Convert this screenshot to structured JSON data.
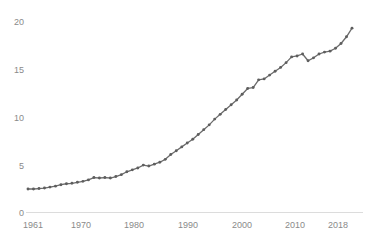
{
  "chart_data": {
    "type": "line",
    "title": "",
    "subtitle": "",
    "xlabel": "",
    "ylabel": "",
    "xlim": [
      1961,
      2020
    ],
    "ylim": [
      0,
      20
    ],
    "grid": false,
    "legend": null,
    "legend_position": "none",
    "marker": "circle",
    "line_color": "#6b6b6b",
    "marker_color": "#5e5e5e",
    "axis_color": "#dcdcdc",
    "tick_label_color": "#8a8a8a",
    "y_ticks": [
      "0",
      "5",
      "10",
      "15",
      "20"
    ],
    "y_tick_values": [
      0,
      5,
      10,
      15,
      20
    ],
    "x_ticks": [
      "1961",
      "1970",
      "1980",
      "1990",
      "2000",
      "2010",
      "2018"
    ],
    "x_tick_values": [
      1961,
      1970,
      1980,
      1990,
      2000,
      2010,
      2018
    ],
    "x": [
      1961,
      1962,
      1963,
      1964,
      1965,
      1966,
      1967,
      1968,
      1969,
      1970,
      1971,
      1972,
      1973,
      1974,
      1975,
      1976,
      1977,
      1978,
      1979,
      1980,
      1981,
      1982,
      1983,
      1984,
      1985,
      1986,
      1987,
      1988,
      1989,
      1990,
      1991,
      1992,
      1993,
      1994,
      1995,
      1996,
      1997,
      1998,
      1999,
      2000,
      2001,
      2002,
      2003,
      2004,
      2005,
      2006,
      2007,
      2008,
      2009,
      2010,
      2011,
      2012,
      2013,
      2014,
      2015,
      2016,
      2017,
      2018,
      2019,
      2020
    ],
    "values": [
      2.4,
      2.4,
      2.45,
      2.5,
      2.6,
      2.7,
      2.85,
      2.95,
      3.0,
      3.1,
      3.2,
      3.35,
      3.6,
      3.55,
      3.6,
      3.55,
      3.7,
      3.9,
      4.2,
      4.4,
      4.6,
      4.9,
      4.8,
      5.0,
      5.2,
      5.5,
      6.0,
      6.4,
      6.8,
      7.2,
      7.6,
      8.1,
      8.6,
      9.1,
      9.7,
      10.2,
      10.7,
      11.2,
      11.7,
      12.3,
      12.9,
      13.0,
      13.8,
      13.9,
      14.3,
      14.7,
      15.1,
      15.6,
      16.2,
      16.3,
      16.5,
      15.8,
      16.1,
      16.5,
      16.7,
      16.8,
      17.1,
      17.6,
      18.3,
      19.2
    ]
  }
}
